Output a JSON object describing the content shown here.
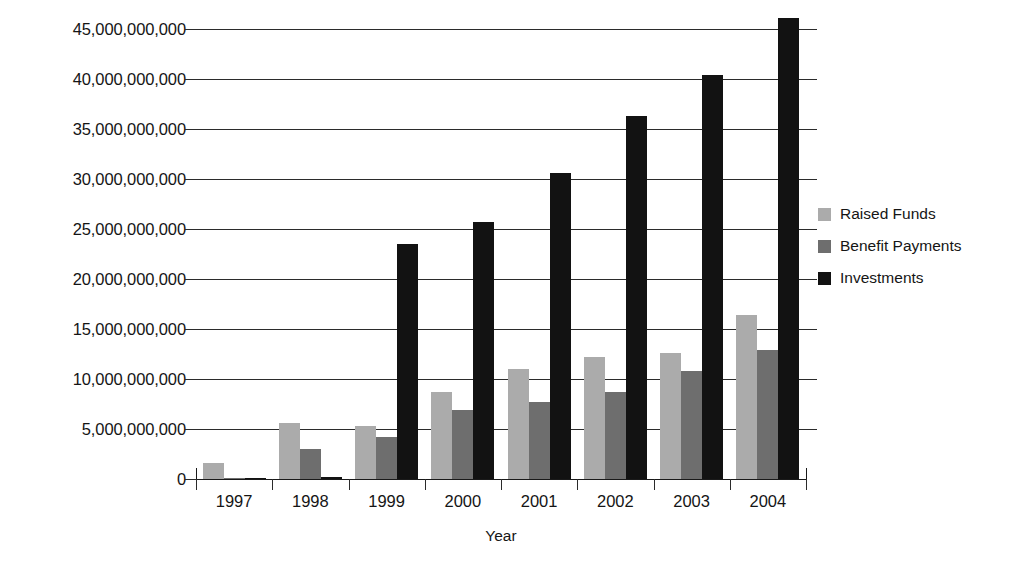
{
  "chart_data": {
    "type": "bar",
    "title": "",
    "xlabel": "Year",
    "ylabel": "Total (₱)",
    "categories": [
      "1997",
      "1998",
      "1999",
      "2000",
      "2001",
      "2002",
      "2003",
      "2004"
    ],
    "series": [
      {
        "name": "Raised Funds",
        "color": "#ababab",
        "values": [
          1600000000,
          5600000000,
          5300000000,
          8700000000,
          11000000000,
          12200000000,
          12600000000,
          16400000000
        ]
      },
      {
        "name": "Benefit Payments",
        "color": "#6e6e6e",
        "values": [
          100000000,
          3000000000,
          4200000000,
          6900000000,
          7700000000,
          8700000000,
          10800000000,
          12900000000
        ]
      },
      {
        "name": "Investments",
        "color": "#121212",
        "values": [
          60000000,
          250000000,
          23500000000,
          25700000000,
          30600000000,
          36300000000,
          40400000000,
          46100000000
        ]
      }
    ],
    "ylim": [
      0,
      45000000000
    ],
    "ytick_values": [
      0,
      5000000000,
      10000000000,
      15000000000,
      20000000000,
      25000000000,
      30000000000,
      35000000000,
      40000000000,
      45000000000
    ],
    "ytick_labels": [
      "0",
      "5,000,000,000",
      "10,000,000,000",
      "15,000,000,000",
      "20,000,000,000",
      "25,000,000,000",
      "30,000,000,000",
      "35,000,000,000",
      "40,000,000,000",
      "45,000,000,000"
    ],
    "grid": true,
    "legend_position": "right"
  },
  "legend": {
    "items": [
      {
        "label": "Raised Funds"
      },
      {
        "label": "Benefit Payments"
      },
      {
        "label": "Investments"
      }
    ]
  },
  "axes": {
    "y_title": "Total (₱)",
    "x_title": "Year"
  }
}
